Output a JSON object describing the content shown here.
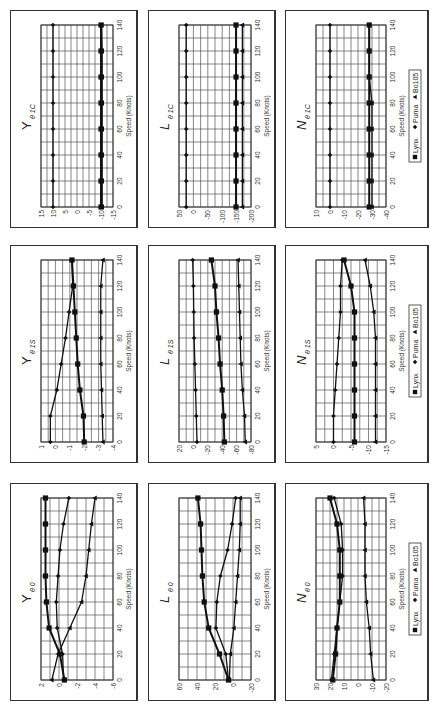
{
  "chart_data": [
    {
      "id": "Y_theta1C",
      "type": "line",
      "title": "Y θ 1C",
      "title_main": "Y",
      "title_sub": "θ 1C",
      "xlabel": "Speed (Knots)",
      "ylabel": "",
      "x": [
        0,
        20,
        40,
        60,
        80,
        100,
        120,
        140
      ],
      "xlim": [
        0,
        140
      ],
      "xticks": [
        0,
        20,
        40,
        60,
        80,
        100,
        120,
        140
      ],
      "ylim": [
        -15,
        15
      ],
      "yticks": [
        15,
        10,
        5,
        0,
        -5,
        -10,
        -15
      ],
      "grid": true,
      "legend": false,
      "series": [
        {
          "name": "Lynx",
          "marker": "square",
          "values": [
            -10,
            -10,
            -10,
            -10,
            -10,
            -10,
            -10,
            -10
          ]
        },
        {
          "name": "Puma",
          "marker": "diamond",
          "values": [
            10,
            10,
            10,
            10,
            10,
            10,
            10,
            10
          ]
        },
        {
          "name": "Bo105",
          "marker": "triangle",
          "values": [
            -10.5,
            -10.5,
            -10.5,
            -10.5,
            -10.5,
            -10.5,
            -10.5,
            -10.3
          ]
        }
      ]
    },
    {
      "id": "L_theta1C",
      "type": "line",
      "title": "L θ 1C",
      "title_main": "L",
      "title_sub": "θ 1C",
      "xlabel": "Speed (Knots)",
      "ylabel": "",
      "x": [
        0,
        20,
        40,
        60,
        80,
        100,
        120,
        140
      ],
      "xlim": [
        0,
        140
      ],
      "xticks": [
        0,
        20,
        40,
        60,
        80,
        100,
        120,
        140
      ],
      "ylim": [
        -200,
        50
      ],
      "yticks": [
        50,
        0,
        -50,
        -100,
        -150,
        -200
      ],
      "grid": true,
      "legend": false,
      "series": [
        {
          "name": "Lynx",
          "marker": "square",
          "values": [
            -148,
            -148,
            -148,
            -148,
            -148,
            -148,
            -148,
            -148
          ]
        },
        {
          "name": "Puma",
          "marker": "diamond",
          "values": [
            25,
            25,
            25,
            25,
            25,
            25,
            25,
            25
          ]
        },
        {
          "name": "Bo105",
          "marker": "triangle",
          "values": [
            -170,
            -170,
            -170,
            -170,
            -170,
            -170,
            -170,
            -170
          ]
        }
      ]
    },
    {
      "id": "N_theta1C",
      "type": "line",
      "title": "N θ 1C",
      "title_main": "N",
      "title_sub": "θ 1C",
      "xlabel": "Speed (Knots)",
      "ylabel": "",
      "x": [
        0,
        20,
        40,
        60,
        80,
        100,
        120,
        140
      ],
      "xlim": [
        0,
        140
      ],
      "xticks": [
        0,
        20,
        40,
        60,
        80,
        100,
        120,
        140
      ],
      "ylim": [
        -40,
        10
      ],
      "yticks": [
        10,
        0,
        -10,
        -20,
        -30,
        -40
      ],
      "grid": true,
      "legend": true,
      "legend_position": "bottom",
      "series": [
        {
          "name": "Lynx",
          "marker": "square",
          "values": [
            -28,
            -28,
            -28,
            -28,
            -28,
            -28,
            -28,
            -28
          ]
        },
        {
          "name": "Puma",
          "marker": "diamond",
          "values": [
            0,
            0,
            0,
            0,
            0,
            0,
            0,
            0
          ]
        },
        {
          "name": "Bo105",
          "marker": "triangle",
          "values": [
            -30,
            -30,
            -30,
            -30,
            -30,
            -28,
            -28,
            -28
          ]
        }
      ]
    },
    {
      "id": "Y_theta1S",
      "type": "line",
      "title": "Y θ 1S",
      "title_main": "Y",
      "title_sub": "θ 1S",
      "xlabel": "Speed (Knots)",
      "ylabel": "",
      "x": [
        0,
        20,
        40,
        60,
        80,
        100,
        120,
        140
      ],
      "xlim": [
        0,
        140
      ],
      "xticks": [
        0,
        20,
        40,
        60,
        80,
        100,
        120,
        140
      ],
      "ylim": [
        -4,
        1
      ],
      "yticks": [
        1,
        0,
        -1,
        -2,
        -3,
        -4
      ],
      "grid": true,
      "legend": false,
      "series": [
        {
          "name": "Lynx",
          "marker": "square",
          "values": [
            -2.0,
            -1.95,
            -1.7,
            -1.55,
            -1.45,
            -1.35,
            -1.25,
            -1.15
          ]
        },
        {
          "name": "Puma",
          "marker": "diamond",
          "values": [
            0.35,
            0.35,
            -0.1,
            -0.4,
            -0.7,
            -0.95,
            -1.2,
            -1.15
          ]
        },
        {
          "name": "Bo105",
          "marker": "triangle",
          "values": [
            -3.3,
            -3.25,
            -3.2,
            -3.15,
            -3.15,
            -3.15,
            -3.15,
            -3.3
          ]
        }
      ]
    },
    {
      "id": "L_theta1S",
      "type": "line",
      "title": "L θ 1S",
      "title_main": "L",
      "title_sub": "θ 1S",
      "xlabel": "Speed (Knots)",
      "ylabel": "",
      "x": [
        0,
        20,
        40,
        60,
        80,
        100,
        120,
        140
      ],
      "xlim": [
        0,
        140
      ],
      "xticks": [
        0,
        20,
        40,
        60,
        80,
        100,
        120,
        140
      ],
      "ylim": [
        -80,
        20
      ],
      "yticks": [
        20,
        0,
        -20,
        -40,
        -60,
        -80
      ],
      "grid": true,
      "legend": false,
      "series": [
        {
          "name": "Lynx",
          "marker": "square",
          "values": [
            -43,
            -42,
            -40,
            -37,
            -35,
            -32,
            -30,
            -25
          ]
        },
        {
          "name": "Puma",
          "marker": "diamond",
          "values": [
            -5,
            -4,
            -3,
            -2,
            -1,
            -0.5,
            0,
            1
          ]
        },
        {
          "name": "Bo105",
          "marker": "triangle",
          "values": [
            -72,
            -71,
            -68,
            -66,
            -65,
            -64,
            -63,
            -62
          ]
        }
      ]
    },
    {
      "id": "N_theta1S",
      "type": "line",
      "title": "N θ 1S",
      "title_main": "N",
      "title_sub": "θ 1S",
      "xlabel": "Speed (Knots)",
      "ylabel": "",
      "x": [
        0,
        20,
        40,
        60,
        80,
        100,
        120,
        140
      ],
      "xlim": [
        0,
        140
      ],
      "xticks": [
        0,
        20,
        40,
        60,
        80,
        100,
        120,
        140
      ],
      "ylim": [
        -15,
        5
      ],
      "yticks": [
        5,
        0,
        -5,
        -10,
        -15
      ],
      "grid": true,
      "legend": true,
      "legend_position": "bottom",
      "series": [
        {
          "name": "Lynx",
          "marker": "square",
          "values": [
            -6,
            -6,
            -6,
            -6,
            -6,
            -6,
            -5,
            -3
          ]
        },
        {
          "name": "Puma",
          "marker": "diamond",
          "values": [
            0,
            0,
            -0.5,
            -1,
            -1.5,
            -2,
            -2,
            -2.5
          ]
        },
        {
          "name": "Bo105",
          "marker": "triangle",
          "values": [
            -12,
            -12,
            -12,
            -12,
            -12,
            -11.5,
            -10.5,
            -9
          ]
        }
      ]
    },
    {
      "id": "Y_theta0",
      "type": "line",
      "title": "Y θ 0",
      "title_main": "Y",
      "title_sub": "θ 0",
      "xlabel": "Speed (Knots)",
      "ylabel": "",
      "x": [
        0,
        20,
        40,
        60,
        80,
        100,
        120,
        140
      ],
      "xlim": [
        0,
        140
      ],
      "xticks": [
        0,
        20,
        40,
        60,
        80,
        100,
        120,
        140
      ],
      "ylim": [
        -6,
        2
      ],
      "yticks": [
        2,
        0,
        -2,
        -4,
        -6
      ],
      "grid": true,
      "legend": false,
      "series": [
        {
          "name": "Lynx",
          "marker": "square",
          "values": [
            -0.6,
            -0.1,
            1.1,
            1.4,
            1.5,
            1.5,
            1.5,
            1.5
          ]
        },
        {
          "name": "Puma",
          "marker": "diamond",
          "values": [
            -0.5,
            -0.4,
            0.2,
            0.3,
            0.1,
            -0.1,
            -0.5,
            -1.1
          ]
        },
        {
          "name": "Bo105",
          "marker": "triangle",
          "values": [
            0.8,
            0.1,
            -1.2,
            -2.5,
            -3.0,
            -3.3,
            -3.6,
            -4.0
          ]
        }
      ]
    },
    {
      "id": "L_theta0",
      "type": "line",
      "title": "L θ 0",
      "title_main": "L",
      "title_sub": "θ 0",
      "xlabel": "Speed (Knots)",
      "ylabel": "",
      "x": [
        0,
        20,
        40,
        60,
        80,
        100,
        120,
        140
      ],
      "xlim": [
        0,
        140
      ],
      "xticks": [
        0,
        20,
        40,
        60,
        80,
        100,
        120,
        140
      ],
      "ylim": [
        -20,
        60
      ],
      "yticks": [
        60,
        40,
        20,
        0,
        -20
      ],
      "grid": true,
      "legend": false,
      "series": [
        {
          "name": "Lynx",
          "marker": "square",
          "values": [
            5,
            15,
            27,
            32,
            34,
            35,
            36,
            39
          ]
        },
        {
          "name": "Puma",
          "marker": "diamond",
          "values": [
            5,
            8,
            19,
            18,
            14,
            6,
            1,
            -3
          ]
        },
        {
          "name": "Bo105",
          "marker": "triangle",
          "values": [
            4,
            3,
            -1,
            -3,
            -5,
            -7,
            -8,
            -8
          ]
        }
      ]
    },
    {
      "id": "N_theta0",
      "type": "line",
      "title": "N θ 0",
      "title_main": "N",
      "title_sub": "θ 0",
      "xlabel": "Speed (Knots)",
      "ylabel": "",
      "x": [
        0,
        20,
        40,
        60,
        80,
        100,
        120,
        140
      ],
      "xlim": [
        0,
        140
      ],
      "xticks": [
        0,
        20,
        40,
        60,
        80,
        100,
        120,
        140
      ],
      "ylim": [
        -20,
        30
      ],
      "yticks": [
        30,
        20,
        10,
        0,
        -10,
        -20
      ],
      "grid": true,
      "legend": true,
      "legend_position": "bottom",
      "series": [
        {
          "name": "Lynx",
          "marker": "square",
          "values": [
            18,
            16,
            15,
            13,
            13,
            13,
            15,
            20
          ]
        },
        {
          "name": "Puma",
          "marker": "diamond",
          "values": [
            19,
            17,
            15,
            13,
            11,
            11,
            12,
            17
          ]
        },
        {
          "name": "Bo105",
          "marker": "triangle",
          "values": [
            -11,
            -9,
            -8,
            -6,
            -5,
            -5,
            -5,
            -4
          ]
        }
      ]
    }
  ],
  "legend": {
    "items": [
      {
        "name": "Lynx",
        "marker": "square"
      },
      {
        "name": "Puma",
        "marker": "diamond"
      },
      {
        "name": "Bo105",
        "marker": "triangle"
      }
    ]
  },
  "layout": {
    "rotation_deg": -90,
    "columns": [
      "Y",
      "L",
      "N"
    ],
    "rows": [
      "θ 1C",
      "θ 1S",
      "θ 0"
    ]
  }
}
